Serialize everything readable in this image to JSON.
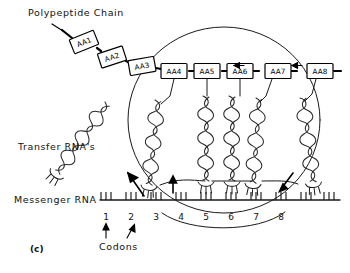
{
  "figure": {
    "panel_label": "(c)",
    "title_absent": "",
    "labels": {
      "polypeptide_chain": "Polypeptide Chain",
      "transfer_rna": "Transfer RNA's",
      "messenger_rna": "Messenger RNA",
      "codons": "Codons"
    },
    "amino_acids": [
      {
        "id": "aa1",
        "label": "AA1",
        "x": 84,
        "y": 42,
        "rot": -22
      },
      {
        "id": "aa2",
        "label": "AA2",
        "x": 112,
        "y": 57,
        "rot": -18
      },
      {
        "id": "aa3",
        "label": "AA3",
        "x": 142,
        "y": 66,
        "rot": -10
      },
      {
        "id": "aa4",
        "label": "AA4",
        "x": 174,
        "y": 71,
        "rot": 0
      },
      {
        "id": "aa5",
        "label": "AA5",
        "x": 207,
        "y": 71,
        "rot": 0
      },
      {
        "id": "aa6",
        "label": "AA6",
        "x": 240,
        "y": 71,
        "rot": 0
      },
      {
        "id": "aa7",
        "label": "AA7",
        "x": 278,
        "y": 71,
        "rot": 0
      },
      {
        "id": "aa8",
        "label": "AA8",
        "x": 320,
        "y": 71,
        "rot": 0
      }
    ],
    "codon_numbers": [
      "1",
      "2",
      "3",
      "4",
      "5",
      "6",
      "7",
      "8"
    ],
    "codon_x_positions": [
      106,
      131,
      156,
      181,
      206,
      231,
      256,
      281
    ],
    "mrna": {
      "line_y": 200,
      "x_start": 100,
      "x_end": 340,
      "codon_count_visible": 10,
      "codon_spacing": 25,
      "ticks_per_codon": 3
    },
    "ribosome": {
      "shape": "ellipse",
      "center_x": 224,
      "center_y": 120,
      "radius_x": 96,
      "radius_y": 93
    },
    "trnas": [
      {
        "id": "trna-exiting",
        "state": "leaving",
        "x": 120,
        "y": 150,
        "angle": -38
      },
      {
        "id": "trna-3",
        "state": "bound",
        "x": 158,
        "y": 140
      },
      {
        "id": "trna-5",
        "state": "bound",
        "x": 207,
        "y": 136
      },
      {
        "id": "trna-6",
        "state": "bound",
        "x": 232,
        "y": 136
      },
      {
        "id": "trna-7",
        "state": "bound",
        "x": 260,
        "y": 136
      },
      {
        "id": "trna-incoming",
        "state": "arriving",
        "x": 310,
        "y": 140
      }
    ],
    "arrows": {
      "chain_growth_direction": "leftward",
      "chain_arrow_x": [
        237,
        295
      ],
      "trna_exit_arrow": "up-left",
      "trna_bind_arrow": "up",
      "trna_incoming_arrow": "down-left",
      "codon_pointer_count": 2
    },
    "colors": {
      "ink": "#1a1a1a",
      "background": "#ffffff",
      "coil": "#2a2a2a"
    }
  }
}
